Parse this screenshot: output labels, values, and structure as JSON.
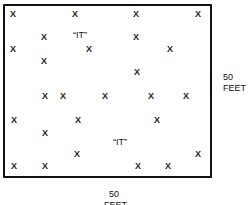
{
  "diagram": {
    "title": "",
    "mark_symbol": "X",
    "it_label": "“IT”",
    "dimensions": {
      "right": {
        "value": "50",
        "unit": "FEET"
      },
      "bottom": {
        "value": "50",
        "unit": "FEET"
      }
    },
    "marks": [
      {
        "x": 13,
        "y": 14
      },
      {
        "x": 75,
        "y": 14
      },
      {
        "x": 136,
        "y": 14
      },
      {
        "x": 198,
        "y": 14
      },
      {
        "x": 44,
        "y": 37
      },
      {
        "x": 136,
        "y": 37
      },
      {
        "x": 13,
        "y": 49
      },
      {
        "x": 89,
        "y": 49
      },
      {
        "x": 170,
        "y": 49
      },
      {
        "x": 44,
        "y": 61
      },
      {
        "x": 137,
        "y": 72
      },
      {
        "x": 45,
        "y": 96
      },
      {
        "x": 63,
        "y": 96
      },
      {
        "x": 105,
        "y": 96
      },
      {
        "x": 151,
        "y": 96
      },
      {
        "x": 186,
        "y": 96
      },
      {
        "x": 14,
        "y": 120
      },
      {
        "x": 78,
        "y": 120
      },
      {
        "x": 157,
        "y": 120
      },
      {
        "x": 45,
        "y": 133
      },
      {
        "x": 77,
        "y": 154
      },
      {
        "x": 198,
        "y": 154
      },
      {
        "x": 14,
        "y": 166
      },
      {
        "x": 45,
        "y": 166
      },
      {
        "x": 138,
        "y": 166
      },
      {
        "x": 168,
        "y": 166
      }
    ],
    "it_positions": [
      {
        "x": 80,
        "y": 35
      },
      {
        "x": 120,
        "y": 142
      }
    ]
  }
}
